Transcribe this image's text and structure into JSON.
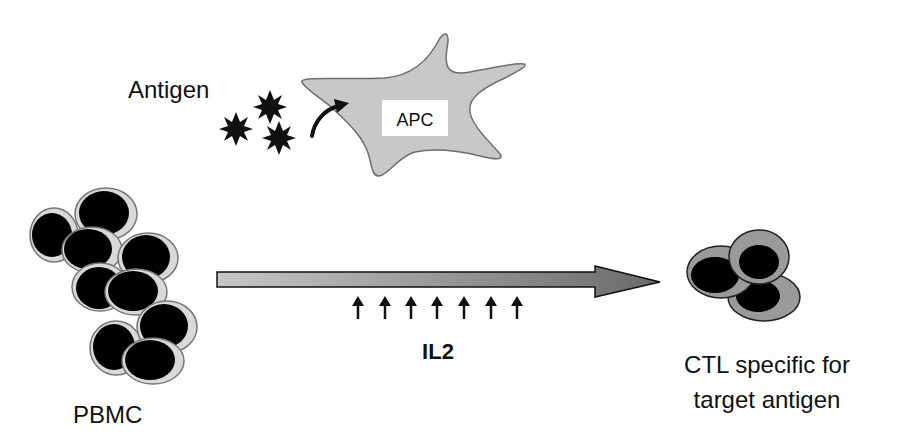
{
  "diagram": {
    "labels": {
      "antigen": "Antigen",
      "apc": "APC",
      "pbmc": "PBMC",
      "il2": "IL2",
      "ctl_line1": "CTL specific for",
      "ctl_line2": "target antigen"
    },
    "nodes": [
      {
        "id": "antigen",
        "label": "Antigen",
        "shape": "star-cluster",
        "count": 3
      },
      {
        "id": "apc",
        "label": "APC",
        "shape": "irregular-star-cell"
      },
      {
        "id": "pbmc",
        "label": "PBMC",
        "shape": "cell-cluster",
        "count": 9
      },
      {
        "id": "il2",
        "label": "IL2",
        "shape": "up-arrow-row",
        "count": 7
      },
      {
        "id": "ctl",
        "label": "CTL specific for target antigen",
        "shape": "cell-cluster",
        "count": 3
      }
    ],
    "edges": [
      {
        "from": "antigen",
        "to": "apc",
        "style": "curved-arrow"
      },
      {
        "from": "pbmc",
        "to": "ctl",
        "style": "gradient-block-arrow",
        "modifier": "il2"
      }
    ],
    "colors": {
      "apc_fill": "#c8c8c8",
      "apc_stroke": "#6e6e6e",
      "pbmc_ring": "#d9d9d9",
      "pbmc_stroke": "#777777",
      "nucleus": "#000000",
      "ctl_fill": "#9a9a9a",
      "ctl_stroke": "#222222",
      "arrow_start": "#c6c6c6",
      "arrow_end": "#6a6a6a",
      "text": "#111111"
    }
  }
}
